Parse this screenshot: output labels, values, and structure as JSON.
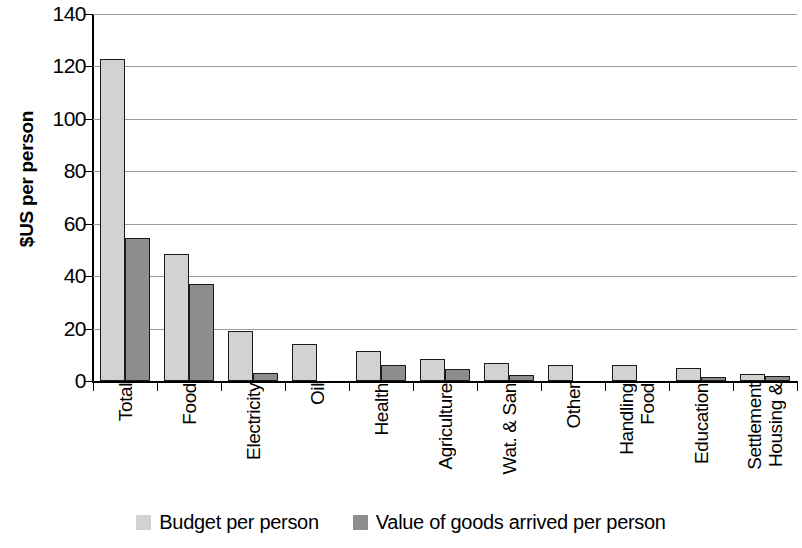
{
  "chart_data": {
    "type": "bar",
    "title": "",
    "xlabel": "",
    "ylabel": "$US per person",
    "ylim": [
      0,
      140
    ],
    "yticks": [
      0,
      20,
      40,
      60,
      80,
      100,
      120,
      140
    ],
    "ytick_labels": [
      "0",
      "20",
      "40",
      "60",
      "80",
      "100",
      "120",
      "140"
    ],
    "grid": true,
    "legend_position": "bottom",
    "categories": [
      "Total",
      "Food",
      "Electricity",
      "Oil",
      "Health",
      "Agriculture",
      "Wat. & San",
      "Other",
      "Food Handling",
      "Education",
      "Housing & Settlement"
    ],
    "category_lines": [
      [
        "Total"
      ],
      [
        "Food"
      ],
      [
        "Electricity"
      ],
      [
        "Oil"
      ],
      [
        "Health"
      ],
      [
        "Agriculture"
      ],
      [
        "Wat. & San"
      ],
      [
        "Other"
      ],
      [
        "Food",
        "Handling"
      ],
      [
        "Education"
      ],
      [
        "Housing &",
        "Settlement"
      ]
    ],
    "series": [
      {
        "name": "Budget per person",
        "color": "#d2d2d2",
        "values": [
          123,
          48.5,
          19,
          14,
          11.5,
          8.5,
          7,
          6,
          6,
          5,
          2.5
        ]
      },
      {
        "name": "Value of goods arrived per person",
        "color": "#8d8d8d",
        "values": [
          54.5,
          37,
          3,
          0,
          6,
          4.5,
          2.3,
          0,
          0,
          1.5,
          2
        ]
      }
    ]
  },
  "legend": {
    "items": [
      {
        "label": "Budget per person",
        "swatch": "light"
      },
      {
        "label": "Value of goods arrived per person",
        "swatch": "dark"
      }
    ]
  },
  "colors": {
    "series_light": "#d2d2d2",
    "series_dark": "#8d8d8d",
    "axis": "#000000",
    "gridline": "#9a9a9a",
    "background": "#ffffff"
  }
}
